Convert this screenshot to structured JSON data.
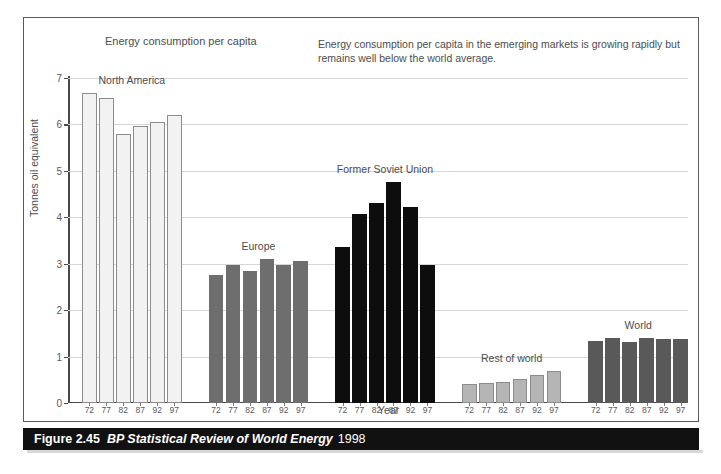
{
  "chart_data": {
    "type": "bar",
    "title": "Energy consumption per capita",
    "annotation": "Energy consumption per capita in the emerging markets is growing rapidly but remains well below the world average.",
    "xlabel": "Year",
    "ylabel": "Tonnes oil equivalent",
    "ylim": [
      0,
      7
    ],
    "yticks": [
      0,
      1,
      2,
      3,
      4,
      5,
      6,
      7
    ],
    "grid": true,
    "legend_position": "none",
    "categories": [
      "72",
      "77",
      "82",
      "87",
      "92",
      "97"
    ],
    "groups": [
      {
        "name": "North America",
        "color": "#f2f2f2",
        "edge_color": "#8c8c8c",
        "values": [
          6.68,
          6.58,
          5.8,
          5.97,
          6.05,
          6.2
        ]
      },
      {
        "name": "Europe",
        "color": "#6e6e6e",
        "edge_color": "#6e6e6e",
        "values": [
          2.75,
          2.97,
          2.85,
          3.1,
          2.98,
          3.05
        ]
      },
      {
        "name": "Former Soviet Union",
        "color": "#0d0d0d",
        "edge_color": "#0d0d0d",
        "values": [
          3.35,
          4.08,
          4.3,
          4.75,
          4.23,
          2.98
        ]
      },
      {
        "name": "Rest of world",
        "color": "#b5b5b5",
        "edge_color": "#8c8c8c",
        "values": [
          0.4,
          0.44,
          0.46,
          0.52,
          0.6,
          0.68
        ]
      },
      {
        "name": "World",
        "color": "#595959",
        "edge_color": "#595959",
        "values": [
          1.33,
          1.4,
          1.32,
          1.4,
          1.37,
          1.38
        ]
      }
    ]
  },
  "caption": {
    "figure_number": "Figure 2.45",
    "source": "BP Statistical Review of World Energy",
    "year": "1998"
  }
}
